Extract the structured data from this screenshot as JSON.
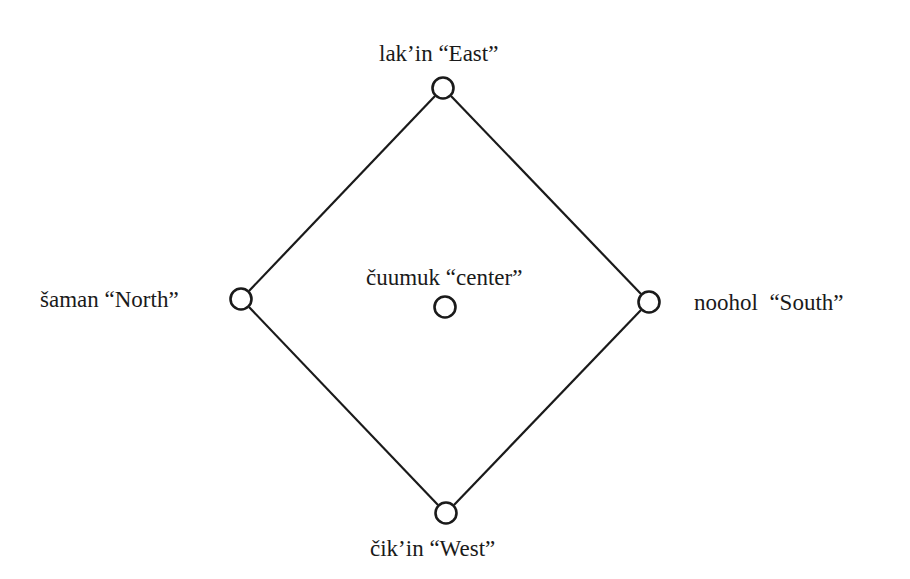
{
  "diagram": {
    "title": "",
    "type": "directional-diamond",
    "colors": {
      "stroke": "#1a1a1a",
      "background": "#ffffff"
    },
    "nodes": [
      {
        "id": "east",
        "label": "lak’in “East”",
        "x": 443,
        "y": 88
      },
      {
        "id": "north",
        "label": "šaman “North”",
        "x": 241,
        "y": 299
      },
      {
        "id": "south",
        "label": "noohol  “South”",
        "x": 649,
        "y": 302
      },
      {
        "id": "west",
        "label": "čik’in “West”",
        "x": 446,
        "y": 513
      },
      {
        "id": "center",
        "label": "čuumuk “center”",
        "x": 445,
        "y": 307
      }
    ],
    "edges": [
      {
        "from": "east",
        "to": "south"
      },
      {
        "from": "south",
        "to": "west"
      },
      {
        "from": "west",
        "to": "north"
      },
      {
        "from": "north",
        "to": "east"
      }
    ]
  }
}
